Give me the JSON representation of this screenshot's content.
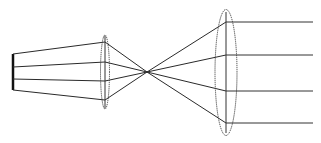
{
  "diagram": {
    "type": "optical-beam-expander",
    "elements": [
      {
        "id": "source",
        "kind": "light-source"
      },
      {
        "id": "lens-1",
        "kind": "converging-lens",
        "size": "small"
      },
      {
        "id": "focal-point",
        "kind": "focus"
      },
      {
        "id": "lens-2",
        "kind": "collimating-lens",
        "size": "large"
      }
    ],
    "ray_count": 4,
    "colors": {
      "ray": "#2a2a2a",
      "lens": "#444444",
      "source": "#111111",
      "background": "#ffffff"
    }
  }
}
